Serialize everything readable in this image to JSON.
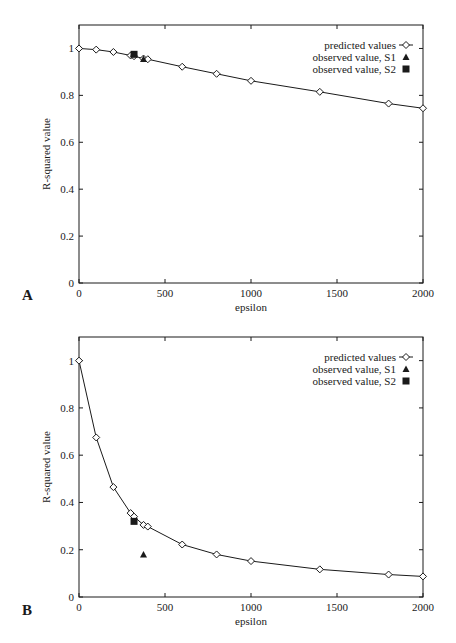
{
  "chart_data": [
    {
      "panel": "A",
      "type": "line",
      "title": "",
      "xlabel": "epsilon",
      "ylabel": "R-squared value",
      "xlim": [
        0,
        2000
      ],
      "ylim": [
        0,
        1.1
      ],
      "xticks": [
        0,
        500,
        1000,
        1500,
        2000
      ],
      "yticks": [
        0,
        0.2,
        0.4,
        0.6,
        0.8,
        1
      ],
      "ytick_labels": [
        "0",
        "0.2",
        "0.4",
        "0.6",
        "0.8",
        "1"
      ],
      "grid": false,
      "legend_position": "upper right",
      "series": [
        {
          "name": "predicted values",
          "marker": "diamond-open",
          "line": true,
          "x": [
            0,
            100,
            200,
            300,
            320,
            375,
            400,
            600,
            800,
            1000,
            1400,
            1800,
            2000
          ],
          "y": [
            1.0,
            0.995,
            0.985,
            0.97,
            0.967,
            0.957,
            0.954,
            0.922,
            0.892,
            0.862,
            0.815,
            0.765,
            0.745
          ]
        },
        {
          "name": "observed value, S1",
          "marker": "triangle-filled",
          "line": false,
          "x": [
            375
          ],
          "y": [
            0.955
          ]
        },
        {
          "name": "observed value, S2",
          "marker": "square-filled",
          "line": false,
          "x": [
            320
          ],
          "y": [
            0.975
          ]
        }
      ]
    },
    {
      "panel": "B",
      "type": "line",
      "title": "",
      "xlabel": "epsilon",
      "ylabel": "R-squared value",
      "xlim": [
        0,
        2000
      ],
      "ylim": [
        0,
        1.1
      ],
      "xticks": [
        0,
        500,
        1000,
        1500,
        2000
      ],
      "yticks": [
        0,
        0.2,
        0.4,
        0.6,
        0.8,
        1
      ],
      "ytick_labels": [
        "0",
        "0.2",
        "0.4",
        "0.6",
        "0.8",
        "1"
      ],
      "grid": false,
      "legend_position": "upper right",
      "series": [
        {
          "name": "predicted values",
          "marker": "diamond-open",
          "line": true,
          "x": [
            0,
            100,
            200,
            300,
            320,
            375,
            400,
            600,
            800,
            1000,
            1400,
            1800,
            2000
          ],
          "y": [
            1.0,
            0.675,
            0.465,
            0.355,
            0.34,
            0.305,
            0.298,
            0.222,
            0.18,
            0.152,
            0.117,
            0.095,
            0.087
          ]
        },
        {
          "name": "observed value, S1",
          "marker": "triangle-filled",
          "line": false,
          "x": [
            375
          ],
          "y": [
            0.18
          ]
        },
        {
          "name": "observed value, S2",
          "marker": "square-filled",
          "line": false,
          "x": [
            320
          ],
          "y": [
            0.32
          ]
        }
      ]
    }
  ],
  "panels": [
    {
      "label": "A"
    },
    {
      "label": "B"
    }
  ],
  "style": {
    "ink": "#1a1a1a",
    "background": "#ffffff"
  }
}
